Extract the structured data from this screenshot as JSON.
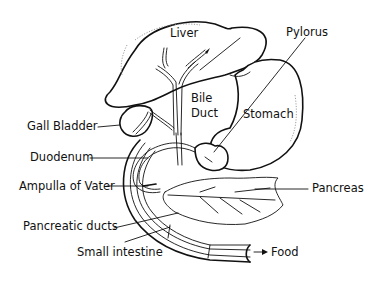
{
  "diagram": {
    "type": "anatomical line drawing",
    "labels": {
      "liver": "Liver",
      "pylorus": "Pylorus",
      "bile_duct_line1": "Bile",
      "bile_duct_line2": "Duct",
      "stomach": "Stomach",
      "gall_bladder": "Gall Bladder",
      "duodenum": "Duodenum",
      "ampulla": "Ampulla of Vater",
      "pancreas": "Pancreas",
      "pancreatic_ducts": "Pancreatic ducts",
      "small_intestine": "Small intestine",
      "food": "Food"
    },
    "colors": {
      "line": "#111111",
      "background": "#ffffff",
      "shading": "#888888"
    }
  }
}
